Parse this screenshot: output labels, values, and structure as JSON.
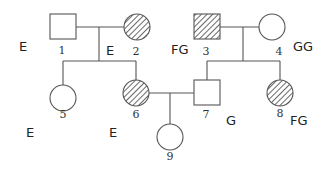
{
  "diagram": {
    "type": "pedigree",
    "legend": {
      "hatched": "affected",
      "open": "unaffected",
      "square": "male",
      "circle": "female"
    },
    "individuals": [
      {
        "id": "1",
        "label": "1",
        "sex": "male",
        "affected": false,
        "annotation": "E"
      },
      {
        "id": "2",
        "label": "2",
        "sex": "female",
        "affected": true,
        "annotation": "E"
      },
      {
        "id": "3",
        "label": "3",
        "sex": "male",
        "affected": true,
        "annotation": "FG"
      },
      {
        "id": "4",
        "label": "4",
        "sex": "female",
        "affected": false,
        "annotation": "GG"
      },
      {
        "id": "5",
        "label": "5",
        "sex": "female",
        "affected": false,
        "annotation": "E"
      },
      {
        "id": "6",
        "label": "6",
        "sex": "female",
        "affected": true,
        "annotation": "E"
      },
      {
        "id": "7",
        "label": "7",
        "sex": "male",
        "affected": false,
        "annotation": "G"
      },
      {
        "id": "8",
        "label": "8",
        "sex": "female",
        "affected": true,
        "annotation": "FG"
      },
      {
        "id": "9",
        "label": "9",
        "sex": "female",
        "affected": false,
        "annotation": ""
      }
    ],
    "couples": [
      [
        "1",
        "2"
      ],
      [
        "3",
        "4"
      ],
      [
        "6",
        "7"
      ]
    ],
    "children": {
      "1x2": [
        "5",
        "6"
      ],
      "3x4": [
        "7",
        "8"
      ],
      "6x7": [
        "9"
      ]
    }
  }
}
